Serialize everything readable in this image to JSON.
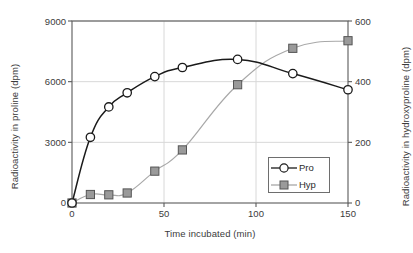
{
  "chart_data": {
    "type": "line",
    "title": "",
    "xlabel": "Time incubated (min)",
    "ylabel": "Radioactivity in proline (dpm)",
    "ylabel_right": "Radioactivity in hydroxyproline (dpm)",
    "x": [
      0,
      10,
      20,
      30,
      45,
      60,
      90,
      120,
      150
    ],
    "xlim": [
      0,
      150
    ],
    "xticks": [
      0,
      50,
      100,
      150
    ],
    "xtick_labels": [
      "0",
      "50",
      "100",
      "150"
    ],
    "ylim": [
      0,
      9000
    ],
    "yticks": [
      0,
      3000,
      6000,
      9000
    ],
    "ytick_labels": [
      "0",
      "3000",
      "6000",
      "9000"
    ],
    "ylim_right": [
      0,
      600
    ],
    "yticks_right": [
      0,
      200,
      400,
      600
    ],
    "ytick_labels_right": [
      "0",
      "200",
      "400",
      "600"
    ],
    "grid": true,
    "legend_position": "lower right",
    "series": [
      {
        "name": "Pro",
        "axis": "left",
        "marker": "circle",
        "marker_fill": "#ffffff",
        "color": "#1a1a1a",
        "values": [
          0,
          3250,
          4750,
          5450,
          6250,
          6700,
          7100,
          6400,
          5600
        ]
      },
      {
        "name": "Hyp",
        "axis": "right",
        "marker": "square",
        "marker_fill": "#9a9a9a",
        "color": "#a8a8a8",
        "values": [
          0,
          28,
          27,
          33,
          105,
          175,
          390,
          510,
          535
        ]
      }
    ],
    "legend": [
      {
        "label": "Pro",
        "marker": "circle"
      },
      {
        "label": "Hyp",
        "marker": "square"
      }
    ],
    "colors": {
      "axis": "#5a5a5a",
      "grid": "#d8d8d8",
      "pro_line": "#1a1a1a",
      "hyp_line": "#a8a8a8",
      "hyp_marker": "#9a9a9a",
      "text": "#3b3b3b",
      "background": "#ffffff"
    }
  }
}
